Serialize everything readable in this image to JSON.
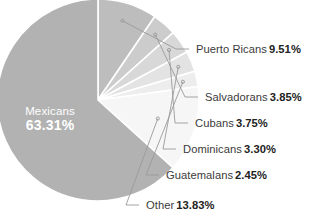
{
  "chart_data": {
    "type": "pie",
    "title": "",
    "subtitle": "",
    "xlabel": "",
    "ylabel": "",
    "legend_position": "callout-labels",
    "grid": false,
    "unit": "%",
    "categories": [
      "Mexicans",
      "Puerto Ricans",
      "Salvadorans",
      "Cubans",
      "Dominicans",
      "Guatemalans",
      "Other"
    ],
    "values": [
      63.31,
      9.51,
      3.85,
      3.75,
      3.3,
      2.45,
      13.83
    ],
    "value_labels": [
      "63.31%",
      "9.51%",
      "3.85%",
      "3.75%",
      "3.30%",
      "2.45%",
      "13.83%"
    ],
    "colors": [
      "#b2b2b2",
      "#bdbdbd",
      "#cccccc",
      "#d8d8d8",
      "#e3e3e3",
      "#ededed",
      "#f6f6f6"
    ],
    "slices": [
      {
        "label": "Mexicans",
        "value": 63.31,
        "value_label": "63.31%",
        "color": "#b2b2b2",
        "label_placement": "inside",
        "label_color": "#ffffff"
      },
      {
        "label": "Puerto Ricans",
        "value": 9.51,
        "value_label": "9.51%",
        "color": "#bdbdbd",
        "label_placement": "callout"
      },
      {
        "label": "Salvadorans",
        "value": 3.85,
        "value_label": "3.85%",
        "color": "#cccccc",
        "label_placement": "callout"
      },
      {
        "label": "Cubans",
        "value": 3.75,
        "value_label": "3.75%",
        "color": "#d8d8d8",
        "label_placement": "callout"
      },
      {
        "label": "Dominicans",
        "value": 3.3,
        "value_label": "3.30%",
        "color": "#e3e3e3",
        "label_placement": "callout"
      },
      {
        "label": "Guatemalans",
        "value": 2.45,
        "value_label": "2.45%",
        "color": "#ededed",
        "label_placement": "callout"
      },
      {
        "label": "Other",
        "value": 13.83,
        "value_label": "13.83%",
        "color": "#f6f6f6",
        "label_placement": "callout"
      }
    ]
  },
  "style": {
    "background": "#ffffff",
    "separator_color": "#ffffff",
    "leader_line_color": "#9a9a9a",
    "callout_text_color": "#3b3b3b",
    "callout_value_color": "#232323",
    "inside_label_color": "#ffffff"
  },
  "geometry": {
    "center_x": 98,
    "center_y": 100,
    "radius": 101,
    "start_angle_deg": -90
  }
}
